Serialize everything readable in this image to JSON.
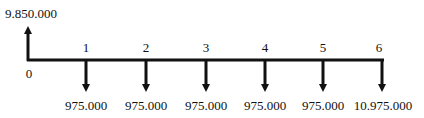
{
  "diagram": {
    "type": "cash-flow-diagram",
    "timeline": {
      "periods": [
        "0",
        "1",
        "2",
        "3",
        "4",
        "5",
        "6"
      ]
    },
    "inflow": {
      "period": "0",
      "label": "9.850.000"
    },
    "outflows": [
      {
        "period": "1",
        "label": "975.000"
      },
      {
        "period": "2",
        "label": "975.000"
      },
      {
        "period": "3",
        "label": "975.000"
      },
      {
        "period": "4",
        "label": "975.000"
      },
      {
        "period": "5",
        "label": "975.000"
      },
      {
        "period": "6",
        "label": "10.975.000"
      }
    ],
    "colors": {
      "line": "#111111",
      "text": "#111111",
      "background": "#ffffff"
    }
  }
}
